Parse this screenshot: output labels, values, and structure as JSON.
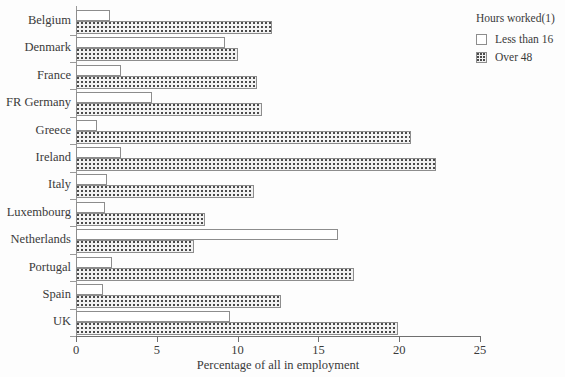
{
  "chart_data": {
    "type": "bar",
    "orientation": "horizontal",
    "title": "",
    "xlabel": "Percentage of  all in employment",
    "ylabel": "",
    "xlim": [
      0,
      25
    ],
    "xticks": [
      0,
      5,
      10,
      15,
      20,
      25
    ],
    "xtick_labels": [
      "0",
      "5",
      "10",
      "15",
      "20",
      "25"
    ],
    "grid": false,
    "legend_position": "top-right",
    "legend_title": "Hours worked(1)",
    "categories": [
      "Belgium",
      "Denmark",
      "France",
      "FR Germany",
      "Greece",
      "Ireland",
      "Italy",
      "Luxembourg",
      "Netherlands",
      "Portugal",
      "Spain",
      "UK"
    ],
    "series": [
      {
        "name": "Less than 16",
        "fill": "white",
        "values": [
          2.1,
          9.2,
          2.8,
          4.7,
          1.3,
          2.8,
          1.9,
          1.8,
          16.2,
          2.2,
          1.7,
          9.5
        ]
      },
      {
        "name": "Over 48",
        "fill": "dotted",
        "values": [
          12.1,
          10.0,
          11.2,
          11.5,
          20.7,
          22.3,
          11.0,
          8.0,
          7.3,
          17.2,
          12.7,
          19.9
        ]
      }
    ]
  },
  "legend": {
    "title": "Hours worked(1)",
    "entries": [
      {
        "label": "Less than 16",
        "swatch": "light"
      },
      {
        "label": "Over 48",
        "swatch": "dark"
      }
    ]
  },
  "axis": {
    "x_title": "Percentage of  all in employment"
  }
}
